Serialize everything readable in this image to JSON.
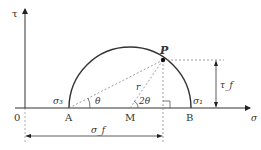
{
  "diagram": {
    "axes": {
      "y_label": "τ",
      "x_label": "σ",
      "origin_label": "0"
    },
    "points": {
      "A": "A",
      "M": "M",
      "B": "B",
      "P": "P"
    },
    "labels": {
      "sigma3": "σ₃",
      "sigma1": "σ₁",
      "theta": "θ",
      "two_theta": "2θ",
      "radius": "r",
      "tau_f": "τ_f",
      "sigma_f": "σ_f"
    },
    "colors": {
      "stroke": "#333333",
      "dashed": "#888888",
      "background": "#ffffff"
    }
  }
}
